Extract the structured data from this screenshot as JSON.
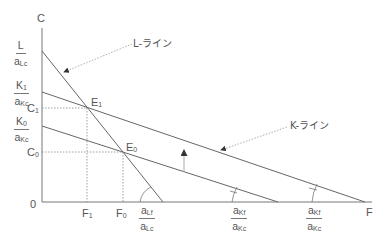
{
  "diagram": {
    "axes": {
      "y_label": "C",
      "x_label": "F",
      "origin": "0"
    },
    "y_ticks": [
      {
        "id": "l_intercept",
        "num": "L",
        "den_main": "a",
        "den_sub": "Lc"
      },
      {
        "id": "k1_intercept",
        "num_main": "K",
        "num_sub": "1",
        "den_main": "a",
        "den_sub": "Kc"
      },
      {
        "id": "c1",
        "main": "C",
        "sub": "1"
      },
      {
        "id": "k0_intercept",
        "num_main": "K",
        "num_sub": "0",
        "den_main": "a",
        "den_sub": "Kc"
      },
      {
        "id": "c0",
        "main": "C",
        "sub": "0"
      }
    ],
    "x_ticks": [
      {
        "id": "f1",
        "main": "F",
        "sub": "1"
      },
      {
        "id": "f0",
        "main": "F",
        "sub": "0"
      },
      {
        "id": "l_slope",
        "num_main": "a",
        "num_sub": "Lf",
        "den_main": "a",
        "den_sub": "Lc"
      },
      {
        "id": "k0_slope",
        "num_main": "a",
        "num_sub": "Kf",
        "den_main": "a",
        "den_sub": "Kc"
      },
      {
        "id": "k1_slope",
        "num_main": "a",
        "num_sub": "Kf",
        "den_main": "a",
        "den_sub": "Kc"
      }
    ],
    "points": [
      {
        "id": "E1",
        "main": "E",
        "sub": "1"
      },
      {
        "id": "E0",
        "main": "E",
        "sub": "0"
      }
    ],
    "callouts": {
      "l_line": "L-ライン",
      "k_line": "K-ライン"
    },
    "colors": {
      "line": "#666666",
      "dotted": "#888888",
      "text": "#555555"
    }
  }
}
